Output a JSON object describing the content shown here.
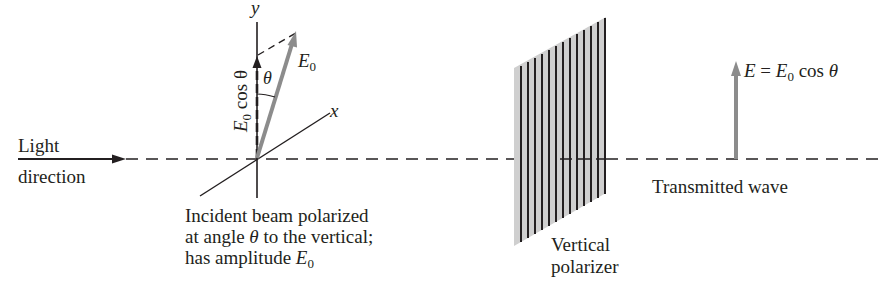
{
  "figure": {
    "colors": {
      "ink": "#231f20",
      "vector_gray": "#8c8c8c",
      "polarizer_fill": "#cfcfcf",
      "background": "#ffffff"
    }
  },
  "labels": {
    "light_direction_line1": "Light",
    "light_direction_line2": "direction",
    "axis_y": "y",
    "axis_x": "x",
    "vector_e0": "E",
    "vector_e0_sub": "0",
    "theta": "θ",
    "component_prefix": "E",
    "component_sub": "0",
    "component_suffix": " cos θ",
    "incident_line1": "Incident beam polarized",
    "incident_line2_a": "at angle ",
    "incident_line2_theta": "θ",
    "incident_line2_b": " to the vertical;",
    "incident_line3_a": "has amplitude ",
    "incident_line3_e": "E",
    "incident_line3_sub": "0",
    "polarizer_line1": "Vertical",
    "polarizer_line2": "polarizer",
    "transmitted_e": "E",
    "transmitted_eq": " = ",
    "transmitted_e0": "E",
    "transmitted_e0_sub": "0",
    "transmitted_cos": " cos ",
    "transmitted_theta": "θ",
    "transmitted_wave": "Transmitted wave"
  },
  "polarizer": {
    "line_count": 13
  }
}
